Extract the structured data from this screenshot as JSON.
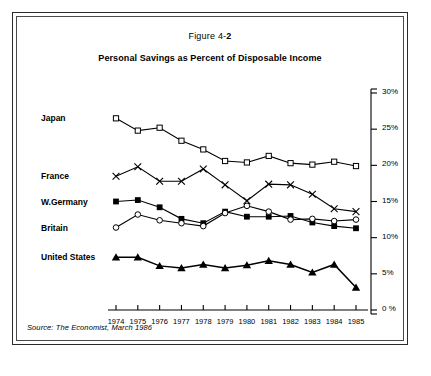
{
  "figure": {
    "number_prefix": "Figure 4-",
    "number": "2",
    "title": "Personal Savings as Percent of Disposable Income",
    "source": "Source: The Economist, March 1986"
  },
  "chart_data": {
    "type": "line",
    "title": "Personal Savings as Percent of Disposable Income",
    "xlabel": "",
    "ylabel": "",
    "ylim": [
      0,
      30
    ],
    "yticks": [
      0,
      5,
      10,
      15,
      20,
      25,
      30
    ],
    "ytick_labels": [
      "0 %",
      "5%",
      "10%",
      "15%",
      "20%",
      "25%",
      "30%"
    ],
    "axis_position": "right",
    "grid": false,
    "legend_position": "left-inline",
    "categories": [
      1974,
      1975,
      1976,
      1977,
      1978,
      1979,
      1980,
      1981,
      1982,
      1983,
      1984,
      1985
    ],
    "xtick_labels": [
      "1974",
      "1975",
      "1976",
      "1977",
      "1978",
      "1979",
      "1980",
      "1981",
      "1982",
      "1983",
      "1984",
      "1985"
    ],
    "series": [
      {
        "name": "Japan",
        "marker": "open-square",
        "values": [
          26.5,
          24.8,
          25.2,
          23.4,
          22.2,
          20.6,
          20.4,
          21.3,
          20.3,
          20.1,
          20.5,
          19.9
        ]
      },
      {
        "name": "France",
        "marker": "cross",
        "values": [
          18.5,
          19.8,
          17.8,
          17.8,
          19.5,
          17.3,
          15.1,
          17.4,
          17.3,
          16.0,
          14.0,
          13.6
        ]
      },
      {
        "name": "W.Germany",
        "marker": "filled-square",
        "values": [
          15.0,
          15.2,
          14.2,
          12.6,
          12.0,
          13.6,
          12.9,
          12.9,
          13.0,
          12.1,
          11.6,
          11.3
        ]
      },
      {
        "name": "Britain",
        "marker": "open-circle",
        "values": [
          11.4,
          13.2,
          12.4,
          12.0,
          11.6,
          13.4,
          14.4,
          13.6,
          12.5,
          12.6,
          12.3,
          12.5
        ]
      },
      {
        "name": "United States",
        "marker": "filled-triangle",
        "values": [
          7.3,
          7.3,
          6.1,
          5.8,
          6.3,
          5.8,
          6.2,
          6.8,
          6.3,
          5.2,
          6.3,
          3.1
        ]
      }
    ]
  }
}
